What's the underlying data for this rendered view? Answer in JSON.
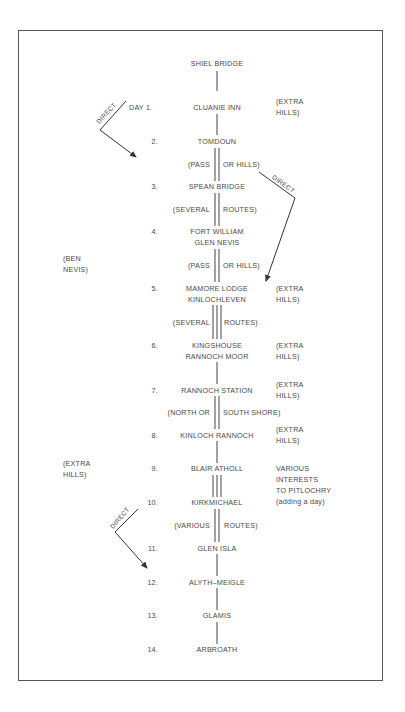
{
  "diagram": {
    "title_station": "SHIEL BRIDGE",
    "stops": [
      {
        "day": "DAY 1.",
        "name": [
          "CLUANIE INN"
        ],
        "note": [
          "(EXTRA",
          "HILLS)"
        ]
      },
      {
        "day": "2.",
        "name": [
          "TOMDOUN"
        ],
        "note": []
      },
      {
        "day": "3.",
        "name": [
          "SPEAN BRIDGE"
        ],
        "note": []
      },
      {
        "day": "4.",
        "name": [
          "FORT WILLIAM",
          "GLEN NEVIS"
        ],
        "note": []
      },
      {
        "day": "5.",
        "name": [
          "MAMORE LODGE",
          "KINLOCHLEVEN"
        ],
        "note": [
          "(EXTRA",
          "HILLS)"
        ]
      },
      {
        "day": "6.",
        "name": [
          "KINGSHOUSE",
          "RANNOCH MOOR"
        ],
        "note": [
          "(EXTRA",
          "HILLS)"
        ]
      },
      {
        "day": "7.",
        "name": [
          "RANNOCH STATION"
        ],
        "note": [
          "(EXTRA",
          "HILLS)"
        ]
      },
      {
        "day": "8.",
        "name": [
          "KINLOCH RANNOCH"
        ],
        "note": [
          "(EXTRA",
          "HILLS)"
        ]
      },
      {
        "day": "9.",
        "name": [
          "BLAIR ATHOLL"
        ],
        "note": [
          "VARIOUS",
          "INTERESTS",
          "TO PITLOCHRY",
          "(adding a day)"
        ]
      },
      {
        "day": "10.",
        "name": [
          "KIRKMICHAEL"
        ],
        "note": []
      },
      {
        "day": "11.",
        "name": [
          "GLEN ISLA"
        ],
        "note": []
      },
      {
        "day": "12.",
        "name": [
          "ALYTH–MEIGLE"
        ],
        "note": []
      },
      {
        "day": "13.",
        "name": [
          "GLAMIS"
        ],
        "note": []
      },
      {
        "day": "14.",
        "name": [
          "ARBROATH"
        ],
        "note": []
      }
    ],
    "route_options": [
      {
        "left": "(PASS",
        "right": "OR HILLS)",
        "between": "TOMDOUN–SPEAN BRIDGE",
        "lines": 2
      },
      {
        "left": "(SEVERAL",
        "right": "ROUTES)",
        "between": "SPEAN BRIDGE–FORT WILLIAM",
        "lines": 2
      },
      {
        "left": "(PASS",
        "right": "OR HILLS)",
        "between": "GLEN NEVIS–MAMORE LODGE",
        "lines": 2
      },
      {
        "left": "(SEVERAL",
        "right": "ROUTES)",
        "between": "KINLOCHLEVEN–KINGSHOUSE",
        "lines": 3
      },
      {
        "left": "(NORTH OR",
        "right": "SOUTH SHORE)",
        "between": "RANNOCH STATION–KINLOCH RANNOCH",
        "lines": 2
      },
      {
        "left": "",
        "right": "",
        "between": "BLAIR ATHOLL–KIRKMICHAEL",
        "lines": 3
      },
      {
        "left": "(VARIOUS",
        "right": "ROUTES)",
        "between": "KIRKMICHAEL–GLEN ISLA",
        "lines": 2
      }
    ],
    "left_notes": [
      {
        "text": [
          "(BEN",
          "NEVIS)"
        ],
        "near": "day 4-5"
      },
      {
        "text": [
          "(EXTRA",
          "HILLS)"
        ],
        "near": "day 9"
      }
    ],
    "shortcuts": [
      {
        "label": "DIRECT",
        "from": "CLUANIE INN",
        "to": "TOMDOUN"
      },
      {
        "label": "DIRECT",
        "from": "TOMDOUN",
        "to": "MAMORE LODGE"
      },
      {
        "label": "DIRECT",
        "from": "KIRKMICHAEL",
        "to": "ALYTH–MEIGLE"
      }
    ]
  }
}
